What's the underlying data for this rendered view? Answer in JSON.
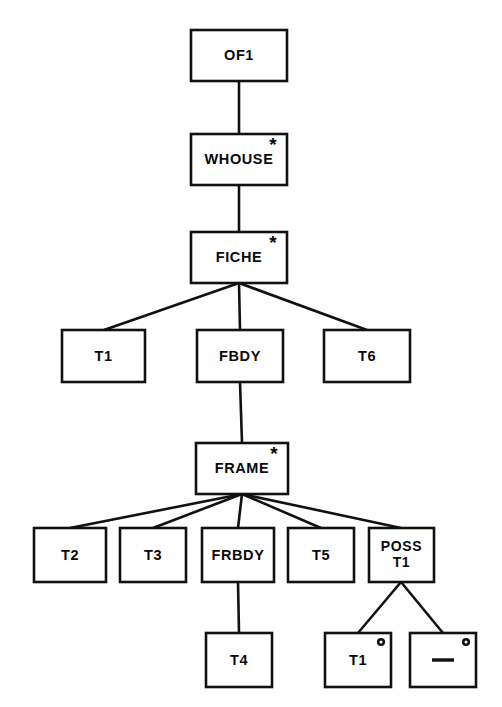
{
  "diagram": {
    "type": "tree-diagram",
    "canvas": {
      "width": 502,
      "height": 707
    },
    "colors": {
      "background": "#fefefe",
      "box_fill": "#ffffff",
      "stroke": "#111111",
      "text": "#0a0a0a"
    },
    "marker_legend": {
      "asterisk": "*",
      "circle": "o",
      "dash": "-"
    },
    "nodes": [
      {
        "id": "of1",
        "label": "OF1",
        "label_lines": [
          "OF1"
        ],
        "marker": "none",
        "level": 0,
        "box": {
          "x": 191,
          "y": 30,
          "w": 96,
          "h": 51
        }
      },
      {
        "id": "whouse",
        "label": "WHOUSE",
        "label_lines": [
          "WHOUSE"
        ],
        "marker": "asterisk",
        "level": 1,
        "box": {
          "x": 191,
          "y": 134,
          "w": 96,
          "h": 51
        }
      },
      {
        "id": "fiche",
        "label": "FICHE",
        "label_lines": [
          "FICHE"
        ],
        "marker": "asterisk",
        "level": 2,
        "box": {
          "x": 191,
          "y": 232,
          "w": 96,
          "h": 51
        }
      },
      {
        "id": "t1-a",
        "label": "T1",
        "label_lines": [
          "T1"
        ],
        "marker": "none",
        "level": 3,
        "box": {
          "x": 62,
          "y": 330,
          "w": 83,
          "h": 52
        }
      },
      {
        "id": "fbdy",
        "label": "FBDY",
        "label_lines": [
          "FBDY"
        ],
        "marker": "none",
        "level": 3,
        "box": {
          "x": 197,
          "y": 330,
          "w": 86,
          "h": 52
        }
      },
      {
        "id": "t6",
        "label": "T6",
        "label_lines": [
          "T6"
        ],
        "marker": "none",
        "level": 3,
        "box": {
          "x": 324,
          "y": 330,
          "w": 86,
          "h": 52
        }
      },
      {
        "id": "frame",
        "label": "FRAME",
        "label_lines": [
          "FRAME"
        ],
        "marker": "asterisk",
        "level": 4,
        "box": {
          "x": 196,
          "y": 443,
          "w": 92,
          "h": 51
        }
      },
      {
        "id": "t2",
        "label": "T2",
        "label_lines": [
          "T2"
        ],
        "marker": "none",
        "level": 5,
        "box": {
          "x": 34,
          "y": 528,
          "w": 72,
          "h": 54
        }
      },
      {
        "id": "t3",
        "label": "T3",
        "label_lines": [
          "T3"
        ],
        "marker": "none",
        "level": 5,
        "box": {
          "x": 120,
          "y": 528,
          "w": 66,
          "h": 54
        }
      },
      {
        "id": "frbdy",
        "label": "FRBDY",
        "label_lines": [
          "FRBDY"
        ],
        "marker": "none",
        "level": 5,
        "box": {
          "x": 202,
          "y": 528,
          "w": 72,
          "h": 54
        }
      },
      {
        "id": "t5",
        "label": "T5",
        "label_lines": [
          "T5"
        ],
        "marker": "none",
        "level": 5,
        "box": {
          "x": 288,
          "y": 528,
          "w": 66,
          "h": 54
        }
      },
      {
        "id": "poss-t1",
        "label": "POSS T1",
        "label_lines": [
          "POSS",
          "T1"
        ],
        "marker": "none",
        "level": 5,
        "box": {
          "x": 369,
          "y": 528,
          "w": 65,
          "h": 54
        }
      },
      {
        "id": "t4",
        "label": "T4",
        "label_lines": [
          "T4"
        ],
        "marker": "none",
        "level": 6,
        "box": {
          "x": 206,
          "y": 633,
          "w": 66,
          "h": 54
        }
      },
      {
        "id": "t1-b",
        "label": "T1",
        "label_lines": [
          "T1"
        ],
        "marker": "circle",
        "level": 6,
        "box": {
          "x": 325,
          "y": 633,
          "w": 66,
          "h": 54
        }
      },
      {
        "id": "dash",
        "label": "-",
        "label_lines": [
          "-"
        ],
        "marker": "circle",
        "is_dash_glyph": true,
        "level": 6,
        "box": {
          "x": 410,
          "y": 633,
          "w": 66,
          "h": 54
        }
      }
    ],
    "edges": [
      {
        "from": "of1",
        "to": "whouse",
        "x1": 239,
        "y1": 81,
        "x2": 239,
        "y2": 134
      },
      {
        "from": "whouse",
        "to": "fiche",
        "x1": 239,
        "y1": 185,
        "x2": 239,
        "y2": 232
      },
      {
        "from": "fiche",
        "to": "t1-a",
        "x1": 239,
        "y1": 283,
        "x2": 104,
        "y2": 330
      },
      {
        "from": "fiche",
        "to": "fbdy",
        "x1": 239,
        "y1": 283,
        "x2": 240,
        "y2": 330
      },
      {
        "from": "fiche",
        "to": "t6",
        "x1": 239,
        "y1": 283,
        "x2": 367,
        "y2": 330
      },
      {
        "from": "fbdy",
        "to": "frame",
        "x1": 240,
        "y1": 382,
        "x2": 242,
        "y2": 443
      },
      {
        "from": "frame",
        "to": "t2",
        "x1": 242,
        "y1": 494,
        "x2": 70,
        "y2": 528
      },
      {
        "from": "frame",
        "to": "t3",
        "x1": 242,
        "y1": 494,
        "x2": 153,
        "y2": 528
      },
      {
        "from": "frame",
        "to": "frbdy",
        "x1": 242,
        "y1": 494,
        "x2": 238,
        "y2": 528
      },
      {
        "from": "frame",
        "to": "t5",
        "x1": 242,
        "y1": 494,
        "x2": 321,
        "y2": 528
      },
      {
        "from": "frame",
        "to": "poss-t1",
        "x1": 242,
        "y1": 494,
        "x2": 401,
        "y2": 528
      },
      {
        "from": "frbdy",
        "to": "t4",
        "x1": 238,
        "y1": 582,
        "x2": 239,
        "y2": 633
      },
      {
        "from": "poss-t1",
        "to": "t1-b",
        "x1": 401,
        "y1": 582,
        "x2": 358,
        "y2": 633
      },
      {
        "from": "poss-t1",
        "to": "dash",
        "x1": 401,
        "y1": 582,
        "x2": 443,
        "y2": 633
      }
    ]
  }
}
